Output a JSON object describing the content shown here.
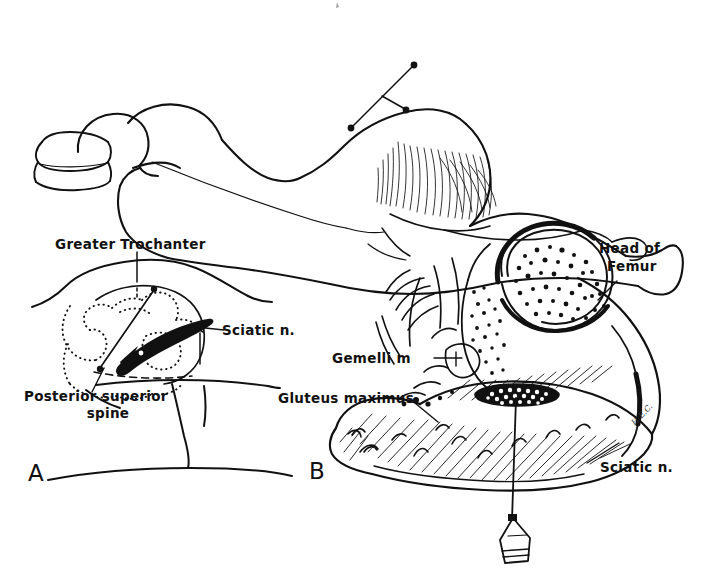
{
  "figure": {
    "domain": "medical-illustration",
    "background_color": "#ffffff",
    "ink_color": "#111111",
    "width": 715,
    "height": 574
  },
  "top_panel": {
    "name": "patient-position-illustration",
    "description": "Patient lying in lateral decubitus (Sims) position with pillow under head, hip and knee flexed, landmark line and needle entry site marked over the buttock"
  },
  "panel_a": {
    "letter": "A",
    "name": "surface-landmarks-panel",
    "labels": [
      {
        "id": "greater-trochanter",
        "text": "Greater Trochanter"
      },
      {
        "id": "sciatic-nerve",
        "text": "Sciatic n."
      },
      {
        "id": "posterior-superior-spine-line1",
        "text": "Posterior  superior"
      },
      {
        "id": "posterior-superior-spine-line2",
        "text": "spine"
      }
    ]
  },
  "panel_b": {
    "letter": "B",
    "name": "cross-section-anatomy-panel",
    "labels": [
      {
        "id": "head-of-femur-line1",
        "text": "Head  of"
      },
      {
        "id": "head-of-femur-line2",
        "text": "Femur"
      },
      {
        "id": "gemelli-muscle",
        "text": "Gemelli  m"
      },
      {
        "id": "gluteus-maximus",
        "text": "Gluteus maximus"
      },
      {
        "id": "sciatic-nerve",
        "text": "Sciatic n."
      }
    ],
    "artist_signature": "H.E.C."
  }
}
